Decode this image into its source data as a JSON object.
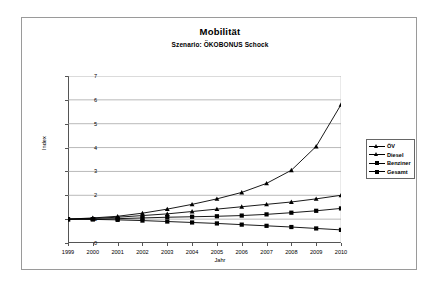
{
  "chart_data": {
    "type": "line",
    "title": "Mobilität",
    "subtitle": "Szenario: ÖKOBONUS Schock",
    "xlabel": "Jahr",
    "ylabel": "Index",
    "grid": true,
    "legend_position": "right",
    "ylim": [
      0,
      7
    ],
    "yticks": [
      0,
      1,
      2,
      3,
      4,
      5,
      6,
      7
    ],
    "categories": [
      1999,
      2000,
      2001,
      2002,
      2003,
      2004,
      2005,
      2006,
      2007,
      2008,
      2009,
      2010
    ],
    "series": [
      {
        "name": "ÖV",
        "marker": "triangle",
        "values": [
          1.0,
          1.05,
          1.12,
          1.25,
          1.42,
          1.62,
          1.85,
          2.12,
          2.5,
          3.05,
          4.05,
          5.8
        ]
      },
      {
        "name": "Diesel",
        "marker": "triangle",
        "values": [
          1.0,
          1.03,
          1.08,
          1.15,
          1.22,
          1.32,
          1.42,
          1.52,
          1.62,
          1.72,
          1.85,
          2.0
        ]
      },
      {
        "name": "Benziner",
        "marker": "square",
        "values": [
          1.0,
          1.0,
          1.02,
          1.05,
          1.08,
          1.1,
          1.12,
          1.15,
          1.2,
          1.27,
          1.35,
          1.45
        ]
      },
      {
        "name": "Gesamt",
        "marker": "square",
        "values": [
          1.0,
          0.99,
          0.97,
          0.94,
          0.9,
          0.86,
          0.82,
          0.77,
          0.72,
          0.67,
          0.61,
          0.55
        ]
      }
    ]
  }
}
